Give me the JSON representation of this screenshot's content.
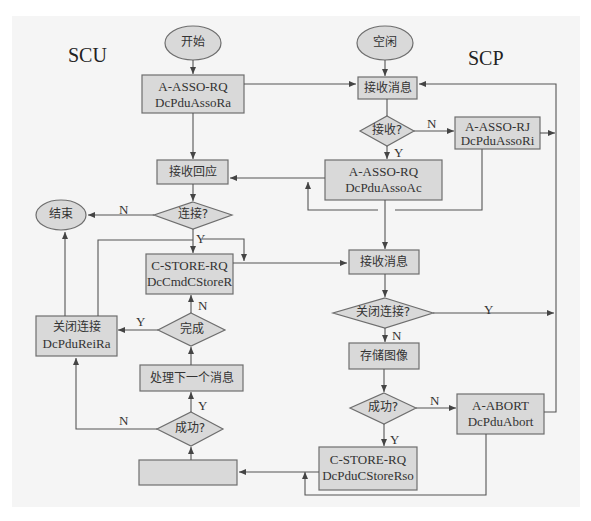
{
  "diagram": {
    "lanes": {
      "left": "SCU",
      "right": "SCP"
    },
    "colors": {
      "panel_bg": "#f5f5f5",
      "node_fill": "#d9d9d9",
      "node_stroke": "#6e6e6e",
      "line": "#555555"
    },
    "scu": {
      "start": "开始",
      "assoc_request": {
        "line1": "A-ASSO-RQ",
        "line2": "DcPduAssoRa"
      },
      "receive_response": "接收回应",
      "connected_decision": "连接?",
      "end": "结束",
      "store_request": {
        "line1": "C-STORE-RQ",
        "line2": "DcCmdCStoreR"
      },
      "done_decision": "完成",
      "close_connection": {
        "line1": "关闭连接",
        "line2": "DcPduReiRa"
      },
      "process_next": "处理下一个消息",
      "success_decision": "成功?",
      "empty_box": ""
    },
    "scp": {
      "idle": "空闲",
      "receive_message_1": "接收消息",
      "accept_decision": "接收?",
      "assoc_reject": {
        "line1": "A-ASSO-RJ",
        "line2": "DcPduAssoRi"
      },
      "assoc_accept": {
        "line1": "A-ASSO-RQ",
        "line2": "DcPduAssoAc"
      },
      "receive_message_2": "接收消息",
      "close_decision": "关闭连接?",
      "store_image": "存储图像",
      "success_decision": "成功?",
      "abort": {
        "line1": "A-ABORT",
        "line2": "DcPduAbort"
      },
      "store_response": {
        "line1": "C-STORE-RQ",
        "line2": "DcPduCStoreRso"
      }
    },
    "edge_labels": {
      "accept_no": "N",
      "accept_yes": "Y",
      "connected_no": "N",
      "connected_yes": "Y",
      "done_no": "N",
      "done_yes": "Y",
      "close_yes": "Y",
      "close_no": "N",
      "scp_success_no": "N",
      "scp_success_yes": "Y",
      "scu_success_yes": "Y",
      "scu_success_no": "N"
    }
  }
}
